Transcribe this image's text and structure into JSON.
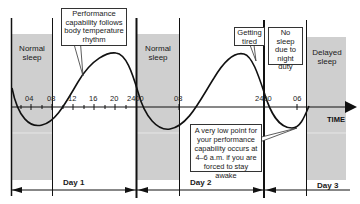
{
  "diagram": {
    "sleep_regions": [
      {
        "label": "Normal sleep",
        "day": "Day 1"
      },
      {
        "label": "Normal sleep",
        "day": "Day 2"
      },
      {
        "label": "Delayed sleep",
        "day": "Day 3"
      }
    ],
    "callouts": {
      "performance": "Performance capability follows body temperature rhythm",
      "getting_tired": "Getting tired",
      "no_sleep": "No sleep due to night duty",
      "low_point": "A very low point for your performance capability occurs at 4–6 a.m. if you are forced to stay awake"
    },
    "axis": {
      "label": "TIME",
      "ticks": [
        "04",
        "08",
        "12",
        "16",
        "20",
        "2400",
        "08",
        "2400",
        "06"
      ]
    },
    "days": [
      "Day 1",
      "Day 2",
      "Day 3"
    ],
    "colors": {
      "sleep_fill": "#cfcfcf",
      "line": "#111111",
      "background": "#ffffff"
    }
  }
}
